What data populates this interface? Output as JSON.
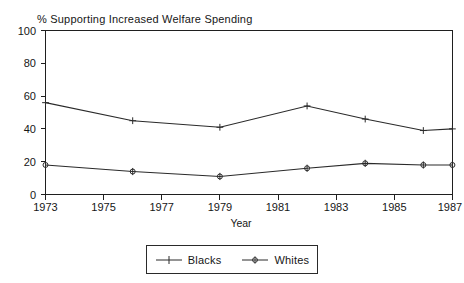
{
  "chart_data": {
    "type": "line",
    "title": "% Supporting Increased Welfare Spending",
    "xlabel": "Year",
    "ylabel": "",
    "xlim": [
      1973,
      1987
    ],
    "ylim": [
      0,
      100
    ],
    "xticks": [
      "1973",
      "1975",
      "1977",
      "1979",
      "1981",
      "1983",
      "1985",
      "1987"
    ],
    "yticks": [
      "0",
      "20",
      "40",
      "60",
      "80",
      "100"
    ],
    "grid": false,
    "legend_position": "bottom-center",
    "x": [
      1973,
      1976,
      1979,
      1982,
      1984,
      1986,
      1987
    ],
    "series": [
      {
        "name": "Blacks",
        "marker": "plus",
        "x": [
          1973,
          1976,
          1979,
          1982,
          1984,
          1986,
          1987
        ],
        "values": [
          56,
          45,
          41,
          54,
          46,
          39,
          40
        ]
      },
      {
        "name": "Whites",
        "marker": "circle",
        "x": [
          1973,
          1976,
          1979,
          1982,
          1984,
          1986,
          1987
        ],
        "values": [
          18,
          14,
          11,
          16,
          19,
          18,
          18
        ]
      }
    ]
  },
  "axes": {
    "y_tick_labels": [
      "100",
      "80",
      "60",
      "40",
      "20",
      "0"
    ],
    "x_tick_labels": [
      "1973",
      "1975",
      "1977",
      "1979",
      "1981",
      "1983",
      "1985",
      "1987"
    ],
    "x_axis_title": "Year"
  },
  "title": {
    "text": "% Supporting Increased Welfare Spending"
  },
  "legend": {
    "entries": [
      {
        "label": "Blacks",
        "marker": "plus-marker"
      },
      {
        "label": "Whites",
        "marker": "circle-marker"
      }
    ]
  }
}
